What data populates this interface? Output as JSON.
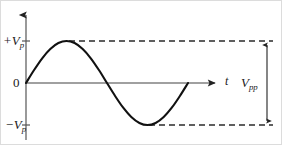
{
  "figure": {
    "kind": "sine-waveform-diagram",
    "background_color": "#ffffff",
    "border_color": "#dcdcdc",
    "curve_color": "#111111",
    "axis_color": "#808080",
    "dash_color": "#2b2b2b"
  },
  "labels": {
    "positive_peak": "+V",
    "positive_peak_sub": "p",
    "zero": "0",
    "negative_peak": "−V",
    "negative_peak_sub": "p",
    "time_axis": "t",
    "peak_to_peak": "V",
    "peak_to_peak_sub": "pp"
  },
  "chart_data": {
    "type": "line",
    "title": "",
    "xlabel": "t",
    "ylabel": "",
    "grid": false,
    "legend": "none",
    "xlim": [
      0,
      1
    ],
    "ylim": [
      -1.25,
      1.25
    ],
    "yticks": [
      1,
      0,
      -1
    ],
    "ytick_labels": [
      "+Vp",
      "0",
      "-Vp"
    ],
    "xticks": [],
    "xtick_labels": [],
    "annotations": [
      {
        "name": "positive-peak-dashed-line",
        "style": "dashed",
        "y": 1,
        "x_start": 0.27,
        "x_end": 1.55
      },
      {
        "name": "negative-peak-dashed-line",
        "style": "dashed",
        "y": -1,
        "x_start": 0.77,
        "x_end": 1.55
      },
      {
        "name": "peak-to-peak-arrow",
        "label": "Vpp",
        "y_from": -1,
        "y_to": 1,
        "double_headed": true
      }
    ],
    "series": [
      {
        "name": "sine",
        "equation": "y = sin(2*pi*x)",
        "x": [
          0,
          0.05,
          0.1,
          0.15,
          0.2,
          0.25,
          0.3,
          0.35,
          0.4,
          0.45,
          0.5,
          0.55,
          0.6,
          0.65,
          0.7,
          0.75,
          0.8,
          0.85,
          0.9,
          0.95,
          1.0
        ],
        "values": [
          0,
          0.309,
          0.588,
          0.809,
          0.951,
          1.0,
          0.951,
          0.809,
          0.588,
          0.309,
          0,
          -0.309,
          -0.588,
          -0.809,
          -0.951,
          -1.0,
          -0.951,
          -0.809,
          -0.588,
          -0.309,
          0
        ]
      }
    ]
  }
}
